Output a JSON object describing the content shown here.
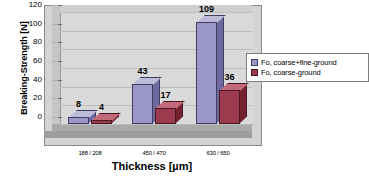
{
  "chart_data": {
    "type": "bar",
    "title": "",
    "subtitle": "",
    "xlabel": "Thickness [µm]",
    "ylabel": "Breaking-Strength [N]",
    "categories": [
      "188 / 208",
      "450 / 470",
      "630 / 650"
    ],
    "series": [
      {
        "name": "Fo, coarse+fine-ground",
        "values": [
          8,
          43,
          109
        ],
        "color": "#9a96c8"
      },
      {
        "name": "Fo, coarse-ground",
        "values": [
          4,
          17,
          36
        ],
        "color": "#9c3a4e"
      }
    ],
    "ylim": [
      0,
      120
    ],
    "yticks": [
      0,
      20,
      40,
      60,
      80,
      100,
      120
    ],
    "ytick_labels": [
      "0",
      "20",
      "40",
      "60",
      "80",
      "100",
      "120"
    ],
    "grid": true,
    "legend_position": "right",
    "data_labels": [
      "8",
      "4",
      "43",
      "17",
      "109",
      "36"
    ],
    "style": "3d-column",
    "plot_background": "#d9d9d9",
    "figure_background": "#ffffff"
  },
  "legend": {
    "items": [
      {
        "label": "Fo, coarse+fine-ground",
        "swatch": "#9a96c8"
      },
      {
        "label": "Fo, coarse-ground",
        "swatch": "#9c3a4e"
      }
    ]
  }
}
